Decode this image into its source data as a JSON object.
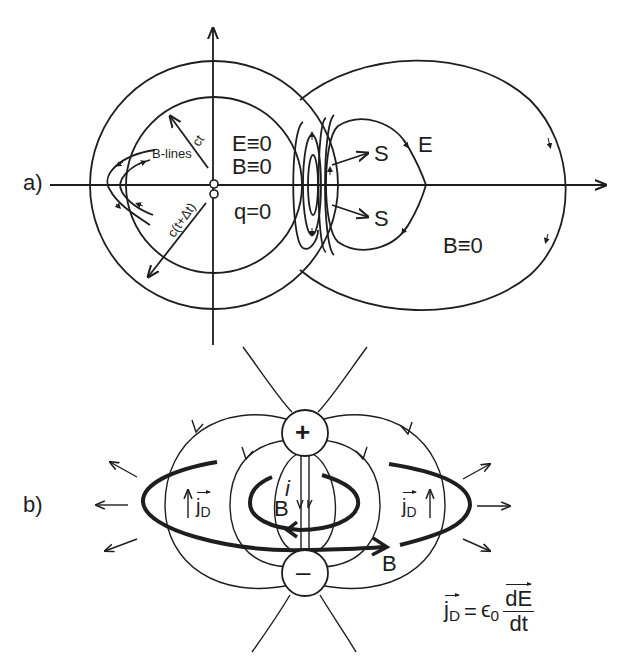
{
  "panel_a": {
    "label": "a)",
    "inner_labels": {
      "E": "E≡0",
      "B": "B≡0",
      "q": "q=0"
    },
    "radius_labels": {
      "inner": "ct",
      "outer": "c(t+Δt)"
    },
    "b_lines_label": "B-lines",
    "outer_labels": {
      "S_top": "S",
      "S_bottom": "S",
      "E": "E",
      "B": "B≡0"
    }
  },
  "panel_b": {
    "label": "b)",
    "plus_charge": "+",
    "minus_charge": "–",
    "current_label": "i",
    "inner_B": "B",
    "outer_B": "B",
    "jD_left": "j",
    "jD_right": "j",
    "jD_sub": "D",
    "formula": {
      "lhs": "j",
      "lhs_sub": "D",
      "eq": "=",
      "eps": "ϵ",
      "eps_sub": "0",
      "num": "dE",
      "den": "dt"
    }
  },
  "colors": {
    "ink": "#1e1e1e",
    "background": "#ffffff"
  }
}
